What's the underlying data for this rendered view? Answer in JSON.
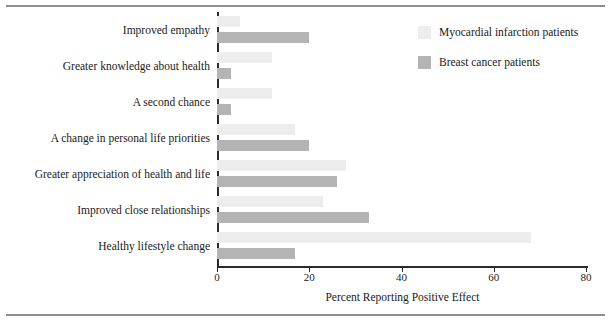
{
  "chart_data": {
    "type": "bar",
    "orientation": "horizontal",
    "title": "",
    "xlabel": "Percent Reporting Positive Effect",
    "ylabel": "",
    "xlim": [
      0,
      80
    ],
    "xticks": [
      0,
      20,
      40,
      60,
      80
    ],
    "xtick_labels": [
      "0",
      "20",
      "40",
      "60",
      "80"
    ],
    "grid": false,
    "legend_position": "top-right",
    "categories": [
      "Improved empathy",
      "Greater knowledge about health",
      "A second chance",
      "A change in personal life priorities",
      "Greater appreciation of health and life",
      "Improved close relationships",
      "Healthy lifestyle change"
    ],
    "series": [
      {
        "name": "Myocardial infarction patients",
        "color": "#ededed",
        "values": [
          5,
          12,
          12,
          17,
          28,
          23,
          68
        ]
      },
      {
        "name": "Breast cancer patients",
        "color": "#b4b4b4",
        "values": [
          20,
          3,
          3,
          20,
          26,
          33,
          17
        ]
      }
    ]
  },
  "legend": {
    "items": [
      {
        "label": "Myocardial infarction patients",
        "swatch": "light"
      },
      {
        "label": "Breast cancer patients",
        "swatch": "dark"
      }
    ]
  },
  "axis": {
    "x_title": "Percent Reporting Positive Effect"
  },
  "colors": {
    "light_bar": "#ededed",
    "dark_bar": "#b4b4b4",
    "axis": "#2b2b2b",
    "rule": "#8e8e8e",
    "background": "#ffffff"
  }
}
